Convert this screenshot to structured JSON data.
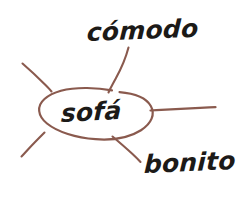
{
  "diagram": {
    "type": "word-web",
    "language": "Spanish",
    "background_color": "#ffffff",
    "stroke_color": "#8a5a4e",
    "text_color": "#1c1a18",
    "center": {
      "label": "sofá",
      "shape": "ellipse"
    },
    "branches": [
      {
        "id": "branch-up-left",
        "label": "",
        "direction": "upper-left"
      },
      {
        "id": "branch-up-comodo",
        "label": "cómodo",
        "direction": "up"
      },
      {
        "id": "branch-right",
        "label": "",
        "direction": "right"
      },
      {
        "id": "branch-down-bonito",
        "label": "bonito",
        "direction": "lower-right"
      },
      {
        "id": "branch-down-left",
        "label": "",
        "direction": "lower-left"
      }
    ],
    "labels": {
      "comodo": "cómodo",
      "bonito": "bonito",
      "sofa": "sofá"
    }
  }
}
